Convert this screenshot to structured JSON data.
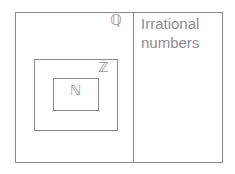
{
  "diagram": {
    "background_color": "#ffffff",
    "line_color": "#8a8a8a",
    "label_color": "#9a9a9a",
    "text_color": "#8d8d8d",
    "regions": {
      "rationals": {
        "label": "ℚ",
        "plain_name": "Q",
        "meaning": "rational numbers"
      },
      "integers": {
        "label": "ℤ",
        "plain_name": "Z",
        "meaning": "integers"
      },
      "naturals": {
        "label": "ℕ",
        "plain_name": "N",
        "meaning": "natural numbers"
      },
      "irrationals": {
        "label": "Irrational\nnumbers",
        "line1": "Irrational",
        "line2": "numbers",
        "meaning": "irrational numbers"
      }
    }
  }
}
